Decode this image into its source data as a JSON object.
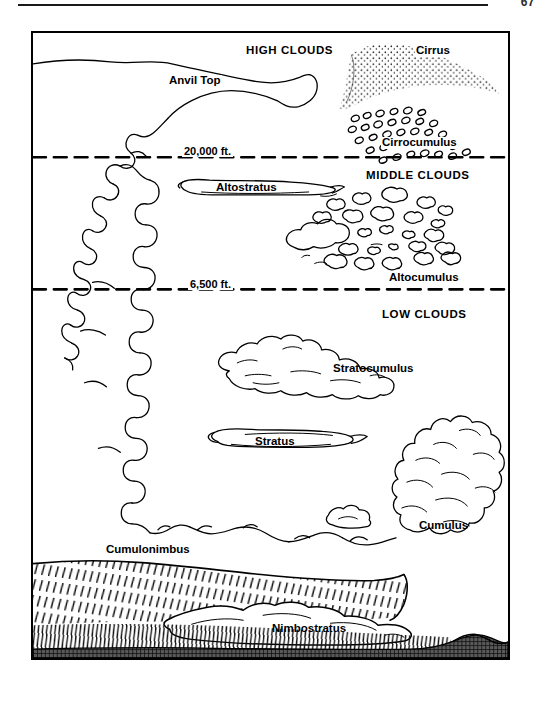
{
  "page": {
    "number": "67",
    "header_rule": true
  },
  "diagram": {
    "zones": [
      {
        "id": "high",
        "label": "HIGH CLOUDS"
      },
      {
        "id": "middle",
        "label": "MIDDLE CLOUDS"
      },
      {
        "id": "low",
        "label": "LOW CLOUDS"
      }
    ],
    "altitude_lines": [
      {
        "id": "upper",
        "label": "20,000 ft.",
        "value": 20000,
        "unit": "ft",
        "style": "dashed"
      },
      {
        "id": "lower",
        "label": "6,500 ft.",
        "value": 6500,
        "unit": "ft",
        "style": "dashed"
      }
    ],
    "cloud_labels": [
      {
        "id": "anvil-top",
        "label": "Anvil Top",
        "zone": "high"
      },
      {
        "id": "cirrus",
        "label": "Cirrus",
        "zone": "high"
      },
      {
        "id": "cirrocumulus",
        "label": "Cirrocumulus",
        "zone": "high"
      },
      {
        "id": "altostratus",
        "label": "Altostratus",
        "zone": "middle"
      },
      {
        "id": "altocumulus",
        "label": "Altocumulus",
        "zone": "middle"
      },
      {
        "id": "stratocumulus",
        "label": "Stratocumulus",
        "zone": "low"
      },
      {
        "id": "stratus",
        "label": "Stratus",
        "zone": "low"
      },
      {
        "id": "cumulus",
        "label": "Cumulus",
        "zone": "low"
      },
      {
        "id": "cumulonimbus",
        "label": "Cumulonimbus",
        "zone": "low"
      },
      {
        "id": "nimbostratus",
        "label": "Nimbostratus",
        "zone": "low"
      }
    ],
    "colors": {
      "ink": "#000000",
      "paper": "#ffffff",
      "ground": "#4a4a4a",
      "ground_hatch": "#111111",
      "rain_hatch": "#1a1a1a"
    }
  }
}
